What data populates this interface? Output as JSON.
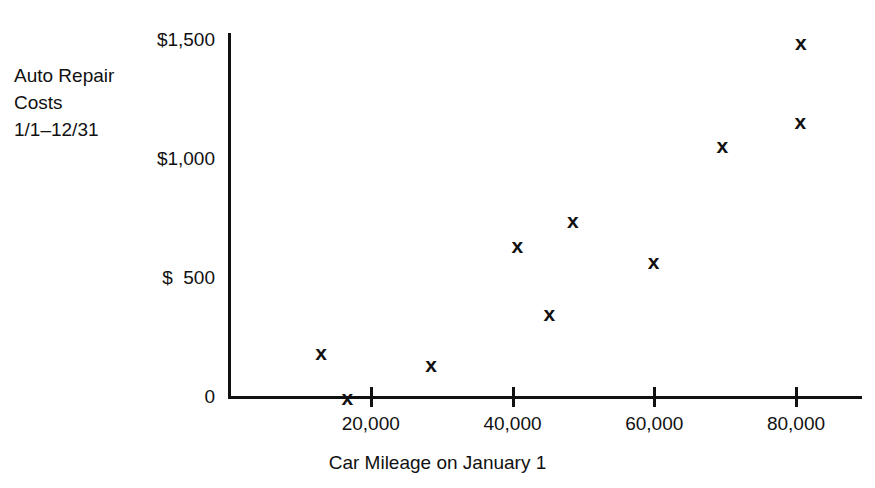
{
  "figure": {
    "width": 875,
    "height": 488,
    "background": "#ffffff",
    "ink_color": "#111111"
  },
  "chart_data": {
    "type": "scatter",
    "title": "",
    "subtitle": "",
    "xlabel": "Car Mileage on January 1",
    "ylabel": "Auto Repair Costs 1/1–12/31",
    "ylabel_lines": [
      "Auto Repair",
      "Costs",
      "1/1–12/31"
    ],
    "xlim": [
      0,
      89000
    ],
    "ylim": [
      0,
      1500
    ],
    "grid": false,
    "legend": null,
    "marker_symbol": "x",
    "xticks": [
      20000,
      40000,
      60000,
      80000
    ],
    "xticklabels": [
      "20,000",
      "40,000",
      "60,000",
      "80,000"
    ],
    "yticks": [
      0,
      500,
      1000,
      1500
    ],
    "yticklabels": [
      "0",
      "$  500",
      "$1,000",
      "$1,500"
    ],
    "x": [
      13000,
      16700,
      28500,
      40700,
      45200,
      48500,
      59900,
      69600,
      80600,
      80700
    ],
    "y": [
      190,
      0,
      140,
      640,
      355,
      745,
      570,
      1060,
      1160,
      1490
    ],
    "points": [
      {
        "x": 13000,
        "y": 190
      },
      {
        "x": 16700,
        "y": 0
      },
      {
        "x": 28500,
        "y": 140
      },
      {
        "x": 40700,
        "y": 640
      },
      {
        "x": 45200,
        "y": 355
      },
      {
        "x": 48500,
        "y": 745
      },
      {
        "x": 59900,
        "y": 570
      },
      {
        "x": 69600,
        "y": 1060
      },
      {
        "x": 80600,
        "y": 1160
      },
      {
        "x": 80700,
        "y": 1490
      }
    ]
  }
}
